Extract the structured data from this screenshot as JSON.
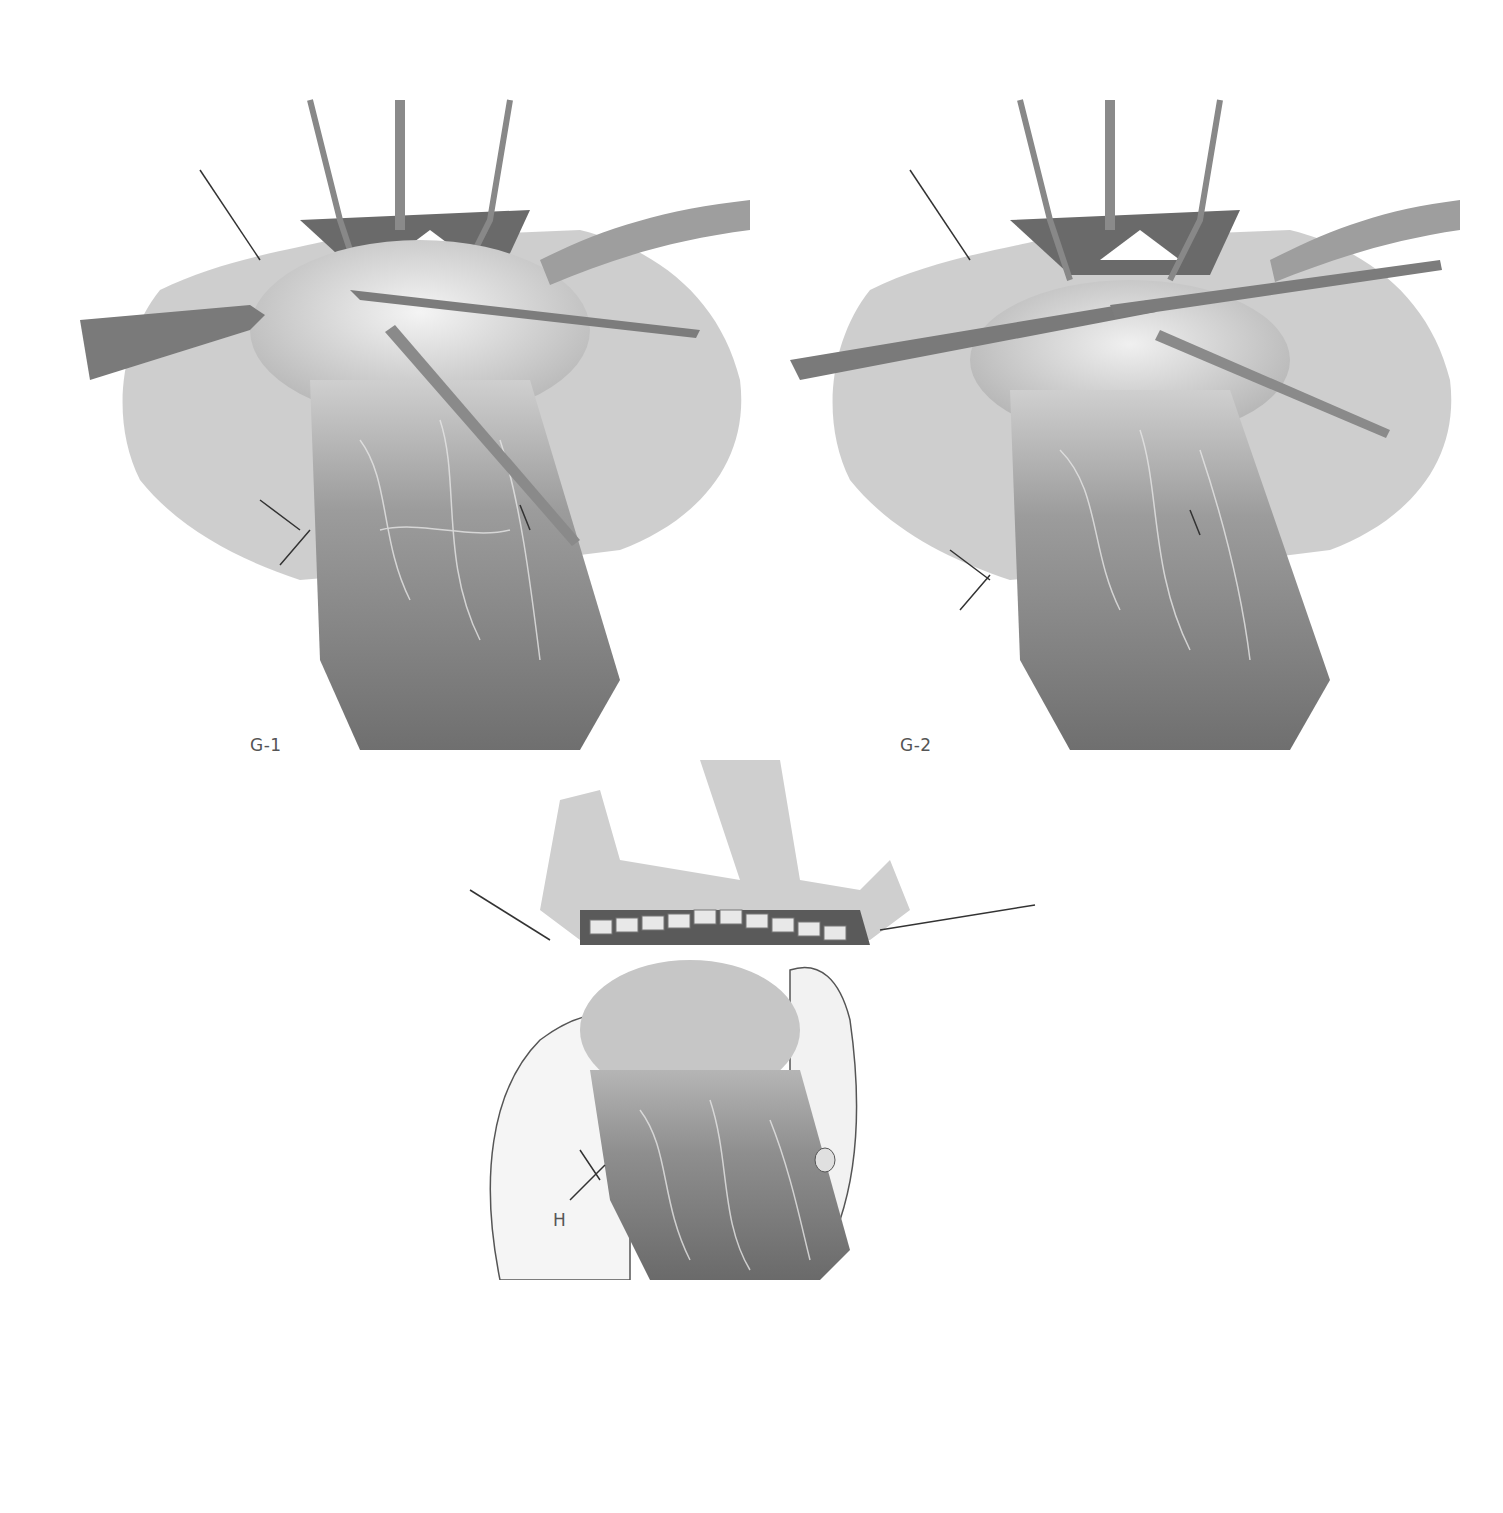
{
  "figure": {
    "panels": [
      {
        "id": "g1",
        "label": "G-1"
      },
      {
        "id": "g2",
        "label": "G-2"
      },
      {
        "id": "h",
        "label": "H"
      }
    ]
  },
  "colors": {
    "background": "#ffffff",
    "tissue_dark": "#6e6e6e",
    "tissue_mid": "#9a9a9a",
    "tissue_light": "#d6d6d6",
    "instrument": "#8a8a8a",
    "label": "#555555"
  }
}
